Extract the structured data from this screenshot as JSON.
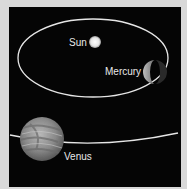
{
  "diagram": {
    "background": "#050505",
    "border_color": "#d9d9d9",
    "labels": {
      "sun": "Sun",
      "mercury": "Mercury",
      "venus": "Venus"
    },
    "bodies": [
      {
        "name": "Sun",
        "type": "star"
      },
      {
        "name": "Mercury",
        "type": "planet",
        "phase": "partial (crescent/half-lit)"
      },
      {
        "name": "Venus",
        "type": "planet",
        "phase": "full"
      }
    ],
    "orbits": [
      {
        "name": "Mercury orbit",
        "shape": "ellipse around Sun"
      },
      {
        "name": "Venus orbit",
        "shape": "arc (partially visible)"
      }
    ]
  }
}
